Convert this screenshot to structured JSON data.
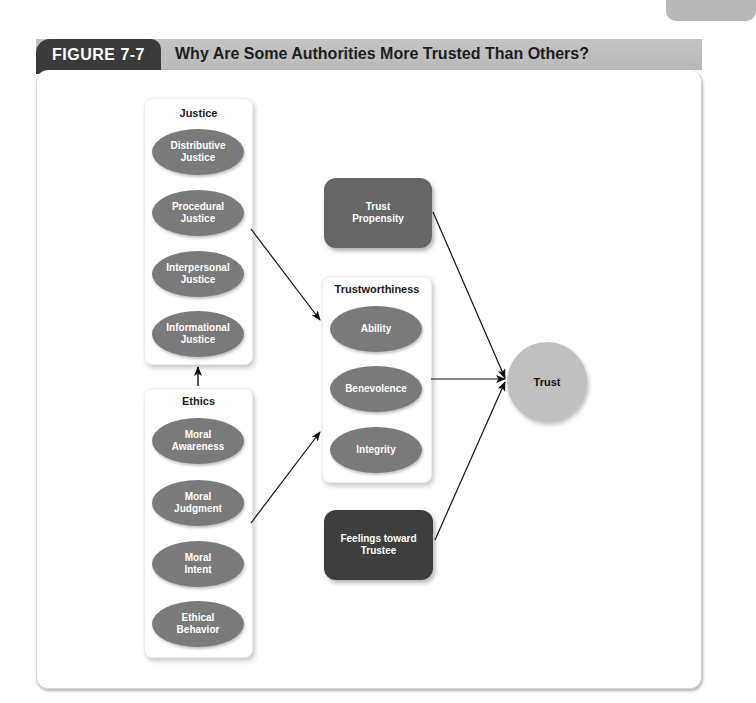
{
  "colors": {
    "figure_label_bg": "#3b3b3b",
    "figure_header_bg": "#bfbfbf",
    "ellipse_fill": "#7a7a7a",
    "trust_propensity_fill": "#666666",
    "feelings_fill": "#3e3e3e",
    "trust_fill": "#c0c0c0",
    "arrow": "#111111"
  },
  "header": {
    "figure_label": "FIGURE 7-7",
    "figure_title": "Why Are Some Authorities More Trusted Than Others?"
  },
  "diagram": {
    "justice": {
      "title": "Justice",
      "items": [
        "Distributive\nJustice",
        "Procedural\nJustice",
        "Interpersonal\nJustice",
        "Informational\nJustice"
      ]
    },
    "ethics": {
      "title": "Ethics",
      "items": [
        "Moral\nAwareness",
        "Moral\nJudgment",
        "Moral\nIntent",
        "Ethical\nBehavior"
      ]
    },
    "trustworthiness": {
      "title": "Trustworthiness",
      "items": [
        "Ability",
        "Benevolence",
        "Integrity"
      ]
    },
    "trust_propensity": "Trust\nPropensity",
    "feelings": "Feelings toward\nTrustee",
    "trust": "Trust",
    "edges": [
      {
        "from": "Ethics",
        "to": "Justice"
      },
      {
        "from": "Justice",
        "to": "Trustworthiness"
      },
      {
        "from": "Ethics",
        "to": "Trustworthiness"
      },
      {
        "from": "Trust Propensity",
        "to": "Trust"
      },
      {
        "from": "Trustworthiness",
        "to": "Trust"
      },
      {
        "from": "Feelings toward Trustee",
        "to": "Trust"
      }
    ]
  }
}
